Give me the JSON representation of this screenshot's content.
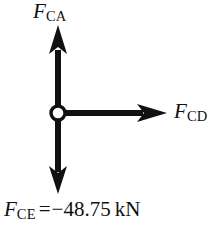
{
  "figure": {
    "background_color": "#ffffff",
    "ink_color": "#111111"
  },
  "joint": {
    "name": "pin-joint-C",
    "center_x": 58,
    "center_y": 113,
    "radius": 8,
    "fill_color": "#ffffff",
    "stroke_color": "#111111"
  },
  "forces": [
    {
      "id": "FCA",
      "symbol": "F",
      "subscript": "CA",
      "direction": "up",
      "label_text": "F",
      "label_subscript": "CA"
    },
    {
      "id": "FCD",
      "symbol": "F",
      "subscript": "CD",
      "direction": "right",
      "label_text": "F",
      "label_subscript": "CD"
    },
    {
      "id": "FCE",
      "symbol": "F",
      "subscript": "CE",
      "direction": "down",
      "label_text": "F",
      "label_subscript": "CE"
    }
  ],
  "labels": {
    "fca": {
      "symbol": "F",
      "subscript": "CA"
    },
    "fcd": {
      "symbol": "F",
      "subscript": "CD"
    }
  },
  "equation": {
    "symbol": "F",
    "subscript": "CE",
    "operator": "=",
    "sign": "−",
    "value": "48.75",
    "unit": "kN",
    "full_text": "F_CE = −48.75 kN"
  }
}
